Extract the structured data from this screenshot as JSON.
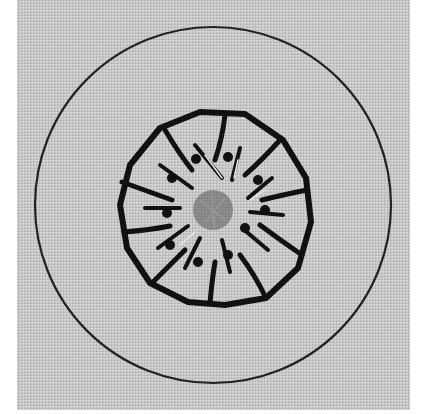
{
  "image": {
    "subject": "Embroidered wheel motif on grey fabric",
    "colors": {
      "fabric": "#c9c9c9",
      "thread": "#111111",
      "highlight": "#e8e8e8"
    },
    "outer_circle": {
      "cx": 213,
      "cy": 205,
      "r": 178
    },
    "inner_wheel": {
      "cx": 212,
      "cy": 210,
      "r": 95,
      "spokes": 12
    }
  }
}
